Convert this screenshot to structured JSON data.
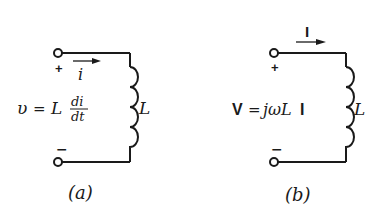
{
  "colors": {
    "stroke": "#1a1a1a",
    "background": "#ffffff"
  },
  "circuit_a": {
    "caption": "(a)",
    "plus": "+",
    "minus": "−",
    "current_label": "i",
    "equation": {
      "lhs": "υ",
      "equals": "=",
      "L": "L",
      "num": "di",
      "den": "dt"
    },
    "inductor_label": "L"
  },
  "circuit_b": {
    "caption": "(b)",
    "plus": "+",
    "minus": "−",
    "current_label": "I",
    "equation": {
      "lhs": "V",
      "equals": "=",
      "rhs": "jωL",
      "I": "I"
    },
    "inductor_label": "L"
  }
}
